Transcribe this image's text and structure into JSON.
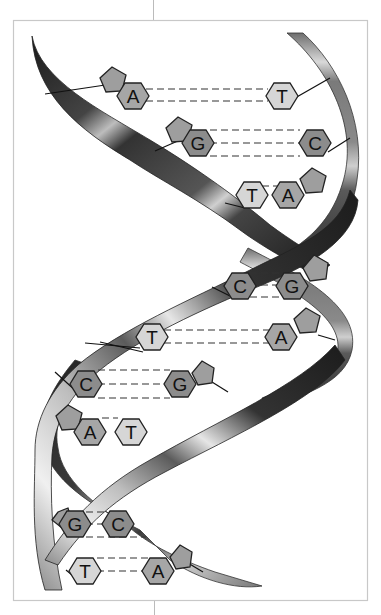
{
  "diagram": {
    "colors": {
      "A": "#a6a6a6",
      "T": "#d6d6d6",
      "G": "#8c8c8c",
      "C": "#8c8c8c",
      "sugar": "#9e9e9e",
      "frame": "#c8c8c8"
    },
    "base_pairs": [
      {
        "left": "A",
        "right": "T",
        "bonds": 2
      },
      {
        "left": "G",
        "right": "C",
        "bonds": 3
      },
      {
        "left": "T",
        "right": "A",
        "bonds": 2
      },
      {
        "left": "C",
        "right": "G",
        "bonds": 3
      },
      {
        "left": "T",
        "right": "A",
        "bonds": 2
      },
      {
        "left": "C",
        "right": "G",
        "bonds": 3
      },
      {
        "left": "A",
        "right": "T",
        "bonds": 2
      },
      {
        "left": "G",
        "right": "C",
        "bonds": 3
      },
      {
        "left": "T",
        "right": "A",
        "bonds": 2
      }
    ],
    "labels": {
      "p1l": "A",
      "p1r": "T",
      "p2l": "G",
      "p2r": "C",
      "p3l": "T",
      "p3r": "A",
      "p4l": "C",
      "p4r": "G",
      "p5l": "T",
      "p5r": "A",
      "p6l": "C",
      "p6r": "G",
      "p7l": "A",
      "p7r": "T",
      "p8l": "G",
      "p8r": "C",
      "p9l": "T",
      "p9r": "A"
    }
  }
}
